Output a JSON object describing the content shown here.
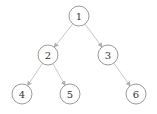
{
  "diagram": {
    "type": "binary-tree",
    "colors": {
      "edge": "#c8c8c8",
      "node_stroke": "#9a9a9a",
      "node_fill": "#ffffff",
      "label": "#333333",
      "arrow": "#b0b0b0"
    },
    "nodes": [
      {
        "id": "1",
        "label": "1",
        "x": 79,
        "y": 16
      },
      {
        "id": "2",
        "label": "2",
        "x": 48,
        "y": 55
      },
      {
        "id": "3",
        "label": "3",
        "x": 108,
        "y": 55
      },
      {
        "id": "4",
        "label": "4",
        "x": 22,
        "y": 94
      },
      {
        "id": "5",
        "label": "5",
        "x": 70,
        "y": 94
      },
      {
        "id": "6",
        "label": "6",
        "x": 136,
        "y": 94
      }
    ],
    "edges": [
      {
        "from": "1",
        "to": "2"
      },
      {
        "from": "1",
        "to": "3"
      },
      {
        "from": "2",
        "to": "4"
      },
      {
        "from": "2",
        "to": "5"
      },
      {
        "from": "3",
        "to": "6"
      }
    ],
    "node_radius": 10
  }
}
